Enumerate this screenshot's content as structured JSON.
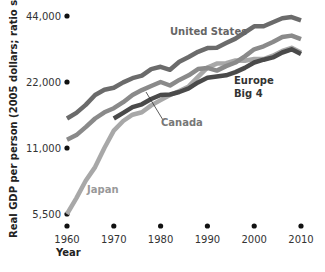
{
  "chart_data": {
    "type": "line",
    "title": "",
    "xlabel": "Year",
    "ylabel": "Real GDP per person (2005 dollars; ratio scale)",
    "yscale": "log",
    "xlim": [
      1960,
      2010
    ],
    "ylim": [
      5500,
      44000
    ],
    "x_ticks": [
      1960,
      1970,
      1980,
      1990,
      2000,
      2010
    ],
    "x_tick_labels": [
      "1960",
      "1970",
      "1980",
      "1990",
      "2000",
      "2010"
    ],
    "y_ticks": [
      5500,
      11000,
      22000,
      44000
    ],
    "y_tick_labels": [
      "5,500",
      "11,000",
      "22,000",
      "44,000"
    ],
    "grid": false,
    "legend": "inline labels",
    "x": [
      1960,
      1962,
      1964,
      1966,
      1968,
      1970,
      1972,
      1974,
      1976,
      1978,
      1980,
      1982,
      1984,
      1986,
      1988,
      1990,
      1992,
      1994,
      1996,
      1998,
      2000,
      2002,
      2004,
      2006,
      2008,
      2010
    ],
    "series": [
      {
        "name": "United States",
        "color": "#6b6b6b",
        "values": [
          15000,
          15900,
          17300,
          19200,
          20300,
          20700,
          21900,
          22900,
          23500,
          25200,
          25800,
          25000,
          27200,
          28600,
          30200,
          31400,
          31500,
          33100,
          34700,
          37000,
          39500,
          39500,
          41200,
          43000,
          43500,
          42000
        ]
      },
      {
        "name": "Canada",
        "color": "#8a8a8a",
        "values": [
          12000,
          12600,
          13700,
          15000,
          16000,
          16700,
          17800,
          19200,
          20200,
          21100,
          22000,
          21200,
          22500,
          23600,
          25200,
          25500,
          24800,
          26000,
          27000,
          28800,
          31000,
          32000,
          33500,
          35300,
          35800,
          34500
        ]
      },
      {
        "name": "Japan",
        "color": "#a8a8a8",
        "values": [
          5500,
          6500,
          7800,
          9000,
          11000,
          13200,
          14600,
          15600,
          16000,
          17200,
          18200,
          19200,
          20000,
          21000,
          23200,
          25600,
          26700,
          26800,
          27600,
          27500,
          28000,
          28000,
          29000,
          30500,
          31500,
          30000
        ]
      },
      {
        "name": "Europe Big 4",
        "color": "#4a4a4a",
        "values": [
          null,
          null,
          null,
          null,
          null,
          15000,
          15900,
          16900,
          17400,
          18400,
          19200,
          19300,
          19800,
          20600,
          21900,
          23000,
          23300,
          23600,
          24400,
          25500,
          27000,
          27800,
          28500,
          30000,
          31000,
          29500
        ]
      }
    ],
    "annotations": [
      {
        "text": "United States",
        "x": 1980,
        "y": 37000
      },
      {
        "text": "Canada",
        "x": 1974,
        "y": 15500,
        "leader_line": true
      },
      {
        "text": "Japan",
        "x": 1964,
        "y": 7800
      },
      {
        "text": "Europe Big 4",
        "x": 1995,
        "y": 20000
      }
    ]
  },
  "labels": {
    "us": "United States",
    "canada": "Canada",
    "japan": "Japan",
    "europe_line1": "Europe",
    "europe_line2": "Big 4",
    "xlabel": "Year",
    "ylabel": "Real GDP per person (2005 dollars; ratio scale)"
  }
}
